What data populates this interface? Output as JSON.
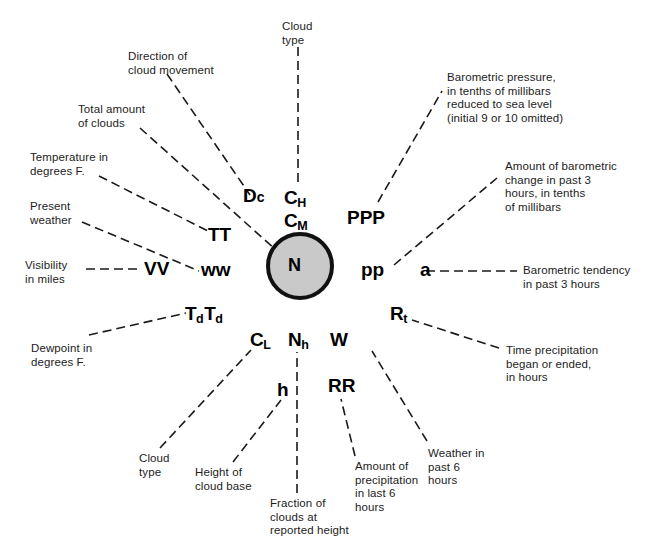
{
  "diagram": {
    "center_symbol": "N",
    "circle_fill": "#c9c9c9",
    "circle_stroke": "#111111"
  },
  "symbols": {
    "dc": "D",
    "dc_sub": "c",
    "ch": "C",
    "ch_sub": "H",
    "cm": "C",
    "cm_sub": "M",
    "tt": "TT",
    "ww": "ww",
    "vv": "VV",
    "tdtd_1": "T",
    "tdtd_1_sub": "d",
    "tdtd_2": "T",
    "tdtd_2_sub": "d",
    "cl": "C",
    "cl_sub": "L",
    "nh": "N",
    "nh_sub": "h",
    "h": "h",
    "w": "W",
    "rr": "RR",
    "rt": "R",
    "rt_sub": "t",
    "ppp": "PPP",
    "pp": "pp",
    "a": "a",
    "n": "N"
  },
  "labels": {
    "cloud_type_high": "Cloud\ntype",
    "direction_of_cloud_movement": "Direction of\ncloud movement",
    "total_amount_of_clouds": "Total amount\nof clouds",
    "temperature": "Temperature in\ndegrees F.",
    "present_weather": "Present\nweather",
    "visibility": "Visibility\nin miles",
    "dewpoint": "Dewpoint in\ndegrees F.",
    "cloud_type_low": "Cloud\ntype",
    "height_of_cloud_base": "Height  of\ncloud base",
    "fraction_of_clouds": "Fraction of\nclouds at\nreported height",
    "amount_of_precipitation": "Amount of\nprecipitation\nin last 6\nhours",
    "weather_past_6_hours": "Weather in\npast 6\nhours",
    "time_precipitation": "Time precipitation\nbegan or ended,\nin hours",
    "barometric_tendency": "Barometric tendency\nin past 3 hours",
    "amount_of_barometric_change": "Amount of barometric\nchange in past 3\nhours, in tenths\nof millibars",
    "barometric_pressure": "Barometric pressure,\nin tenths of millibars\nreduced to sea level\n(initial 9 or 10 omitted)"
  }
}
